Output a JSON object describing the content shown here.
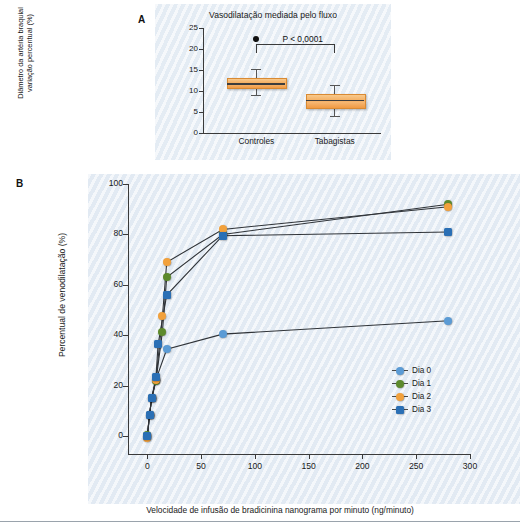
{
  "panel_a": {
    "letter": "A",
    "title": "Vasodilatação mediada pelo fluxo",
    "ylabel": "Diâmetro da artéria braquial\nvariação percentual (%)",
    "pvalue": "P < 0,0001",
    "yticks": [
      "25",
      "20",
      "15",
      "10",
      "5",
      "0"
    ],
    "xticklabels": [
      "Controles",
      "Tabagistas"
    ]
  },
  "panel_b": {
    "letter": "B",
    "ylabel": "Percentual de venodilatação (%)",
    "xlabel": "Velocidade de infusão de bradicinina nanograma por minuto  (ng/minuto)",
    "yticks": [
      "100",
      "80",
      "60",
      "40",
      "20",
      "0"
    ],
    "xticks": [
      "0",
      "50",
      "100",
      "150",
      "200",
      "250",
      "300"
    ],
    "legend": [
      {
        "label": "Dia 0",
        "color": "#5b9bd5",
        "shape": "c"
      },
      {
        "label": "Dia 1",
        "color": "#5d8a2c",
        "shape": "c"
      },
      {
        "label": "Dia 2",
        "color": "#f2a13c",
        "shape": "c"
      },
      {
        "label": "Dia 3",
        "color": "#2a6fb5",
        "shape": "s"
      }
    ]
  },
  "colors": {
    "box_fill": "#f4ac5d",
    "box_edge": "#d98a33",
    "axis": "#3a3a3a",
    "panel_bg": "#e9eff6",
    "dia0": "#5b9bd5",
    "dia1": "#5d8a2c",
    "dia2": "#f2a13c",
    "dia3": "#2a6fb5"
  },
  "chart_data": [
    {
      "type": "box",
      "title": "Vasodilatação mediada pelo fluxo",
      "xlabel": "",
      "ylabel": "Diâmetro da artéria braquial variação percentual (%)",
      "ylim": [
        0,
        25
      ],
      "yticks": [
        0,
        5,
        10,
        15,
        20,
        25
      ],
      "grid": false,
      "annotations": [
        "P < 0,0001"
      ],
      "categories": [
        "Controles",
        "Tabagistas"
      ],
      "boxes": [
        {
          "category": "Controles",
          "whisker_low": 9.0,
          "q1": 11.0,
          "median": 11.8,
          "q3": 13.2,
          "whisker_high": 15.2
        },
        {
          "category": "Tabagistas",
          "whisker_low": 4.0,
          "q1": 6.3,
          "median": 7.9,
          "q3": 9.4,
          "whisker_high": 11.4
        }
      ]
    },
    {
      "type": "line",
      "title": "",
      "xlabel": "Velocidade de infusão de bradicinina nanograma por minuto  (ng/minuto)",
      "ylabel": "Percentual de venodilatação (%)",
      "xlim": [
        -18,
        300
      ],
      "ylim": [
        -7,
        100
      ],
      "xticks": [
        0,
        50,
        100,
        150,
        200,
        250,
        300
      ],
      "yticks": [
        0,
        20,
        40,
        60,
        80,
        100
      ],
      "grid": false,
      "legend_position": "right-bottom",
      "x": [
        0,
        2,
        4,
        8,
        18,
        70,
        280
      ],
      "series": [
        {
          "name": "Dia 0",
          "color": "#5b9bd5",
          "shape": "circle",
          "x": [
            0,
            2,
            4,
            8,
            18,
            70,
            280
          ],
          "values": [
            0.0,
            8.5,
            15.0,
            22.5,
            34.5,
            40.5,
            45.8
          ]
        },
        {
          "name": "Dia 1",
          "color": "#5d8a2c",
          "shape": "circle",
          "x": [
            0,
            2,
            4,
            8,
            18,
            70,
            280
          ],
          "values": [
            0.5,
            8.5,
            15.0,
            22.0,
            41.5,
            63.0,
            80.0,
            92.0
          ]
        },
        {
          "name": "Dia 2",
          "color": "#f2a13c",
          "shape": "circle",
          "x": [
            0,
            2,
            4,
            8,
            18,
            70,
            280
          ],
          "values": [
            -0.5,
            8.5,
            15.0,
            22.5,
            47.5,
            69.0,
            82.0,
            91.0
          ]
        },
        {
          "name": "Dia 3",
          "color": "#2a6fb5",
          "shape": "square",
          "x": [
            0,
            2,
            4,
            8,
            18,
            70,
            280
          ],
          "values": [
            0.0,
            8.5,
            15.0,
            23.5,
            36.5,
            56.0,
            79.5,
            81.0
          ]
        }
      ]
    }
  ],
  "series_points": {
    "dia0": [
      [
        0,
        0.0
      ],
      [
        2,
        8.5
      ],
      [
        4,
        15.0
      ],
      [
        8,
        22.5
      ],
      [
        18,
        34.5
      ],
      [
        70,
        40.5
      ],
      [
        280,
        45.8
      ]
    ],
    "dia1": [
      [
        0,
        0.5
      ],
      [
        2,
        8.5
      ],
      [
        4,
        15.0
      ],
      [
        8,
        22.0
      ],
      [
        14,
        41.5
      ],
      [
        18,
        63.0
      ],
      [
        70,
        80.0
      ],
      [
        280,
        92.0
      ]
    ],
    "dia2": [
      [
        0,
        -0.5
      ],
      [
        2,
        8.5
      ],
      [
        4,
        15.0
      ],
      [
        8,
        22.5
      ],
      [
        14,
        47.5
      ],
      [
        18,
        69.0
      ],
      [
        70,
        82.0
      ],
      [
        280,
        91.0
      ]
    ],
    "dia3": [
      [
        0,
        0.0
      ],
      [
        2,
        8.5
      ],
      [
        4,
        15.0
      ],
      [
        8,
        23.5
      ],
      [
        10,
        36.5
      ],
      [
        18,
        56.0
      ],
      [
        70,
        79.5
      ],
      [
        280,
        81.0
      ]
    ]
  }
}
